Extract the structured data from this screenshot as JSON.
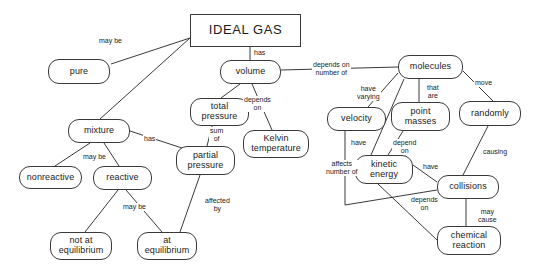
{
  "diagram": {
    "type": "concept-map",
    "canvas": {
      "width": 540,
      "height": 273
    },
    "style": {
      "background": "#ffffff",
      "node_stroke": "#3a3a3a",
      "node_fill": "#ffffff",
      "edge_stroke": "#3a3a3a",
      "text_color": "#1a1a1a"
    },
    "nodes": [
      {
        "id": "ideal_gas",
        "label": "IDEAL GAS",
        "shape": "rect",
        "x": 190,
        "y": 14,
        "w": 111,
        "h": 33
      },
      {
        "id": "pure",
        "label": "pure",
        "shape": "rounded",
        "x": 48,
        "y": 59,
        "w": 62,
        "h": 25
      },
      {
        "id": "mixture",
        "label": "mixture",
        "shape": "rounded",
        "x": 68,
        "y": 119,
        "w": 62,
        "h": 24
      },
      {
        "id": "nonreactive",
        "label": "nonreactive",
        "shape": "rounded",
        "x": 19,
        "y": 166,
        "w": 63,
        "h": 23
      },
      {
        "id": "reactive",
        "label": "reactive",
        "shape": "rounded",
        "x": 93,
        "y": 166,
        "w": 59,
        "h": 24
      },
      {
        "id": "not_at_equilibrium",
        "label": "not at\nequilibrium",
        "shape": "rounded",
        "x": 50,
        "y": 232,
        "w": 62,
        "h": 28
      },
      {
        "id": "at_equilibrium",
        "label": "at\nequilibrium",
        "shape": "rounded",
        "x": 137,
        "y": 232,
        "w": 60,
        "h": 28
      },
      {
        "id": "volume",
        "label": "volume",
        "shape": "rounded",
        "x": 220,
        "y": 60,
        "w": 61,
        "h": 24
      },
      {
        "id": "total_pressure",
        "label": "total\npressure",
        "shape": "rounded",
        "x": 190,
        "y": 98,
        "w": 59,
        "h": 28
      },
      {
        "id": "partial_pressure",
        "label": "partial\npressure",
        "shape": "rounded",
        "x": 176,
        "y": 146,
        "w": 59,
        "h": 29
      },
      {
        "id": "kelvin_temperature",
        "label": "Kelvin\ntemperature",
        "shape": "rounded",
        "x": 243,
        "y": 130,
        "w": 66,
        "h": 28
      },
      {
        "id": "molecules",
        "label": "molecules",
        "shape": "rounded",
        "x": 398,
        "y": 55,
        "w": 65,
        "h": 24
      },
      {
        "id": "velocity",
        "label": "velocity",
        "shape": "rounded",
        "x": 327,
        "y": 107,
        "w": 59,
        "h": 24
      },
      {
        "id": "point_masses",
        "label": "point\nmasses",
        "shape": "rounded",
        "x": 391,
        "y": 102,
        "w": 59,
        "h": 29
      },
      {
        "id": "randomly",
        "label": "randomly",
        "shape": "rounded",
        "x": 459,
        "y": 101,
        "w": 62,
        "h": 25
      },
      {
        "id": "kinetic_energy",
        "label": "kinetic\nenergy",
        "shape": "rounded",
        "x": 355,
        "y": 155,
        "w": 58,
        "h": 29
      },
      {
        "id": "collisions",
        "label": "collisions",
        "shape": "rounded",
        "x": 437,
        "y": 175,
        "w": 62,
        "h": 24
      },
      {
        "id": "chemical_reaction",
        "label": "chemical\nreaction",
        "shape": "rounded",
        "x": 437,
        "y": 226,
        "w": 64,
        "h": 29
      }
    ],
    "edges": [
      {
        "id": "e1",
        "from": "ideal_gas",
        "to": "pure",
        "label": "may be",
        "label_x": 98,
        "label_y": 37,
        "points": "190,38 111,64"
      },
      {
        "id": "e2",
        "from": "ideal_gas",
        "to": "mixture",
        "label": "",
        "label_x": 0,
        "label_y": 0,
        "points": "190,38 100,119"
      },
      {
        "id": "e3",
        "from": "ideal_gas",
        "to": "volume",
        "label": "has",
        "label_x": 253,
        "label_y": 49,
        "points": "250,47 250,60"
      },
      {
        "id": "e4",
        "from": "volume",
        "to": "molecules",
        "label": "depends on\nnumber of",
        "label_x": 312,
        "label_y": 61,
        "points": "281,70 398,67"
      },
      {
        "id": "e5",
        "from": "volume",
        "to": "total_pressure",
        "label": "",
        "label_x": 0,
        "label_y": 0,
        "points": "240,84 221,98"
      },
      {
        "id": "e6",
        "from": "volume",
        "to": "kelvin_temperature",
        "label": "depends\non",
        "label_x": 243,
        "label_y": 96,
        "points": "252,84 272,130"
      },
      {
        "id": "e7",
        "from": "total_pressure",
        "to": "partial_pressure",
        "label": "sum\nof",
        "label_x": 209,
        "label_y": 127,
        "points": "212,126 207,146"
      },
      {
        "id": "e8",
        "from": "mixture",
        "to": "partial_pressure",
        "label": "has",
        "label_x": 143,
        "label_y": 135,
        "points": "130,131 182,148"
      },
      {
        "id": "e9",
        "from": "mixture",
        "to": "nonreactive",
        "label": "may be",
        "label_x": 82,
        "label_y": 153,
        "points": "90,143 55,166"
      },
      {
        "id": "e10",
        "from": "mixture",
        "to": "reactive",
        "label": "",
        "label_x": 0,
        "label_y": 0,
        "points": "104,143 119,166"
      },
      {
        "id": "e11",
        "from": "reactive",
        "to": "not_at_equilibrium",
        "label": "may be",
        "label_x": 122,
        "label_y": 203,
        "points": "118,190 85,232"
      },
      {
        "id": "e12",
        "from": "reactive",
        "to": "at_equilibrium",
        "label": "",
        "label_x": 0,
        "label_y": 0,
        "points": "126,190 162,232"
      },
      {
        "id": "e13",
        "from": "partial_pressure",
        "to": "at_equilibrium",
        "label": "affected\nby",
        "label_x": 204,
        "label_y": 197,
        "points": "200,175 180,232"
      },
      {
        "id": "e14",
        "from": "molecules",
        "to": "velocity",
        "label": "have\nvarying",
        "label_x": 356,
        "label_y": 85,
        "points": "398,73 368,107"
      },
      {
        "id": "e15",
        "from": "molecules",
        "to": "point_masses",
        "label": "that\nare",
        "label_x": 426,
        "label_y": 84,
        "points": "419,79 419,102"
      },
      {
        "id": "e16",
        "from": "molecules",
        "to": "randomly",
        "label": "move",
        "label_x": 474,
        "label_y": 79,
        "points": "463,71 493,101"
      },
      {
        "id": "e17",
        "from": "molecules",
        "to": "kinetic_energy",
        "label": "have",
        "label_x": 350,
        "label_y": 139,
        "points": "404,79 371,155"
      },
      {
        "id": "e18",
        "from": "point_masses",
        "to": "kinetic_energy",
        "label": "depend\non",
        "label_x": 392,
        "label_y": 139,
        "points": "403,131 388,155"
      },
      {
        "id": "e19",
        "from": "kinetic_energy",
        "to": "collisions",
        "label": "have",
        "label_x": 422,
        "label_y": 163,
        "points": "413,165 437,182"
      },
      {
        "id": "e20",
        "from": "velocity",
        "to": "collisions",
        "label": "affects\nnumber of",
        "label_x": 325,
        "label_y": 160,
        "points": "345,131 345,205 437,190"
      },
      {
        "id": "e21",
        "from": "kinetic_energy",
        "to": "chemical_reaction",
        "label": "depends\non",
        "label_x": 410,
        "label_y": 196,
        "points": "378,184 437,240"
      },
      {
        "id": "e22",
        "from": "collisions",
        "to": "chemical_reaction",
        "label": "may\ncause",
        "label_x": 477,
        "label_y": 208,
        "points": "466,199 466,226"
      },
      {
        "id": "e23",
        "from": "randomly",
        "to": "collisions",
        "label": "causing",
        "label_x": 482,
        "label_y": 148,
        "points": "488,126 463,175"
      }
    ]
  }
}
